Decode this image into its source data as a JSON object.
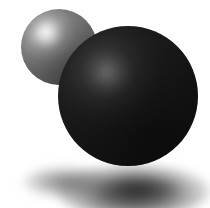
{
  "canvas": {
    "width": 210,
    "height": 208,
    "background_color": "#ffffff",
    "alt_text": "Two shaded spheres on a white background with soft drop shadows"
  },
  "objects": [
    {
      "name": "small-sphere",
      "shape": "sphere",
      "center_x": 59,
      "center_y": 47,
      "radius": 38,
      "base_color": "#6d6d6d",
      "highlight_color": "#ececec",
      "terminator_color": "#3f3f3f",
      "highlight_x": 46,
      "highlight_y": 33,
      "z_order": 1
    },
    {
      "name": "large-sphere",
      "shape": "sphere",
      "center_x": 128,
      "center_y": 96,
      "radius": 70,
      "base_color": "#151515",
      "highlight_color": "#5a5a5a",
      "terminator_color": "#0e0e0e",
      "highlight_x": 106,
      "highlight_y": 72,
      "z_order": 2
    }
  ],
  "shadows": [
    {
      "name": "small-sphere-shadow",
      "center_x": 65,
      "center_y": 182,
      "radius_x": 43,
      "radius_y": 16,
      "opacity": 0.62,
      "blur": 5
    },
    {
      "name": "large-sphere-shadow",
      "center_x": 133,
      "center_y": 191,
      "radius_x": 77,
      "radius_y": 27,
      "opacity": 0.8,
      "blur": 5
    },
    {
      "name": "large-sphere-contact-shadow",
      "center_x": 139,
      "center_y": 189,
      "radius_x": 43,
      "radius_y": 13,
      "opacity": 0.68,
      "blur": 6
    }
  ],
  "lighting": {
    "direction": "upper-left",
    "key_light_x_pct": 33,
    "key_light_y_pct": 32,
    "ambient": "low"
  }
}
